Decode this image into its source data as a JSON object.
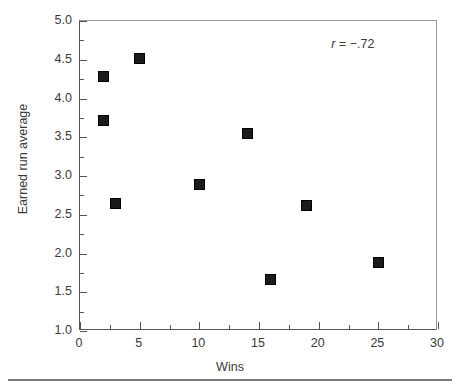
{
  "chart_data": {
    "type": "scatter",
    "title": "",
    "xlabel": "Wins",
    "ylabel": "Earned run average",
    "xlim": [
      0,
      30
    ],
    "ylim": [
      1.0,
      5.0
    ],
    "grid": false,
    "legend": null,
    "x_major_ticks": [
      0,
      5,
      10,
      15,
      20,
      25,
      30
    ],
    "x_tick_labels": [
      "0",
      "5",
      "10",
      "15",
      "20",
      "25",
      "30"
    ],
    "x_minor_ticks": [
      2.5,
      7.5,
      12.5,
      17.5,
      22.5,
      27.5
    ],
    "y_major_ticks": [
      1.0,
      1.5,
      2.0,
      2.5,
      3.0,
      3.5,
      4.0,
      4.5,
      5.0
    ],
    "y_tick_labels": [
      "1.0",
      "1.5",
      "2.0",
      "2.5",
      "3.0",
      "3.5",
      "4.0",
      "4.5",
      "5.0"
    ],
    "y_minor_ticks": [
      1.25,
      1.75,
      2.25,
      2.75,
      3.25,
      3.75,
      4.25,
      4.75
    ],
    "marker": "filled-square",
    "marker_color": "#1b1b1b",
    "points": [
      {
        "x": 2,
        "y": 4.28
      },
      {
        "x": 2,
        "y": 3.72
      },
      {
        "x": 3,
        "y": 2.65
      },
      {
        "x": 5,
        "y": 4.51
      },
      {
        "x": 10,
        "y": 2.89
      },
      {
        "x": 14,
        "y": 3.55
      },
      {
        "x": 16,
        "y": 1.66
      },
      {
        "x": 19,
        "y": 2.62
      },
      {
        "x": 25,
        "y": 1.88
      }
    ],
    "annotations": [
      {
        "name": "correlation",
        "variable": "r",
        "operator": " = ",
        "value": "−.72",
        "text": "r = −.72",
        "x": 25.5,
        "y": 4.68
      }
    ]
  },
  "figure": {
    "axis_color": "#555555",
    "frame_color": "#9b9b9b",
    "text_color": "#3a3a3a",
    "background": "#ffffff",
    "rule_color": "#7a7a7a"
  }
}
